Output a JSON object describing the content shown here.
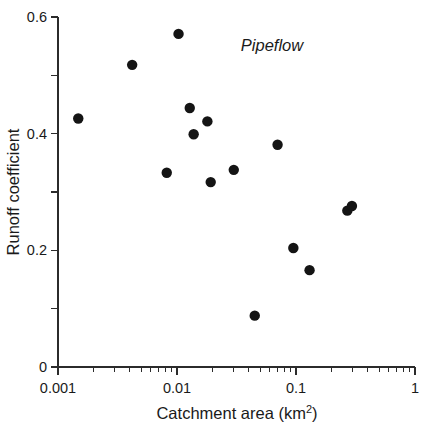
{
  "chart_data": {
    "type": "scatter",
    "title": "",
    "annotation": "Pipeflow",
    "xlabel_main": "Catchment area (km",
    "xlabel_sup": "2",
    "xlabel_tail": ")",
    "xlabel_full": "Catchment area (km2)",
    "ylabel": "Runoff coefficient",
    "xscale": "log",
    "yscale": "linear",
    "xlim": [
      0.001,
      1
    ],
    "ylim": [
      0,
      0.6
    ],
    "grid": false,
    "legend": "none",
    "xticks": [
      0.001,
      0.01,
      0.1,
      1
    ],
    "xtick_labels": [
      "0.001",
      "0.01",
      "0.1",
      "1"
    ],
    "yticks": [
      0,
      0.2,
      0.4,
      0.6
    ],
    "ytick_labels": [
      "0",
      "0.2",
      "0.4",
      "0.6"
    ],
    "yticks_minor": [
      0.1,
      0.3,
      0.5
    ],
    "marker": "filled-circle",
    "marker_color": "#141414",
    "points": [
      {
        "x": 0.00148,
        "y": 0.426
      },
      {
        "x": 0.0042,
        "y": 0.518
      },
      {
        "x": 0.0103,
        "y": 0.571
      },
      {
        "x": 0.0082,
        "y": 0.333
      },
      {
        "x": 0.0128,
        "y": 0.444
      },
      {
        "x": 0.0138,
        "y": 0.399
      },
      {
        "x": 0.018,
        "y": 0.421
      },
      {
        "x": 0.0192,
        "y": 0.317
      },
      {
        "x": 0.03,
        "y": 0.338
      },
      {
        "x": 0.045,
        "y": 0.088
      },
      {
        "x": 0.07,
        "y": 0.381
      },
      {
        "x": 0.095,
        "y": 0.204
      },
      {
        "x": 0.13,
        "y": 0.166
      },
      {
        "x": 0.27,
        "y": 0.268
      },
      {
        "x": 0.295,
        "y": 0.276
      }
    ]
  },
  "axis": {
    "x_tick_labels": [
      "0.001",
      "0.01",
      "0.1",
      "1"
    ],
    "y_tick_labels": [
      "0",
      "0.2",
      "0.4",
      "0.6"
    ]
  },
  "labels": {
    "annotation": "Pipeflow",
    "y_axis_title": "Runoff coefficient",
    "x_axis_title_main": "Catchment area (km",
    "x_axis_title_sup": "2",
    "x_axis_title_tail": ")"
  }
}
